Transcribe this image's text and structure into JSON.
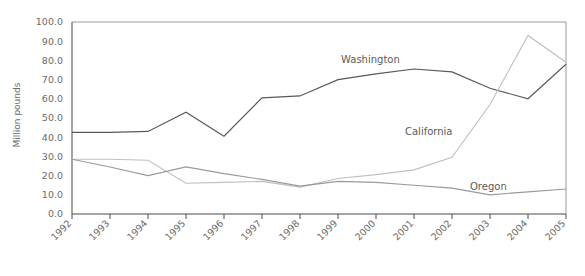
{
  "chart_data": {
    "type": "line",
    "title": "",
    "xlabel": "",
    "ylabel": "Million pounds",
    "grid": false,
    "legend": "inline-labels",
    "ylim": [
      0,
      100
    ],
    "ytick_step": 10,
    "ytick_labels": [
      "0.0",
      "10.0",
      "20.0",
      "30.0",
      "40.0",
      "50.0",
      "60.0",
      "70.0",
      "80.0",
      "90.0",
      "100.0"
    ],
    "categories": [
      "1992",
      "1993",
      "1994",
      "1995",
      "1996",
      "1997",
      "1998",
      "1999",
      "2000",
      "2001",
      "2002",
      "2003",
      "2004",
      "2005"
    ],
    "series": [
      {
        "name": "Washington",
        "color": "#595959",
        "label_x": 341,
        "label_y": 63,
        "values": [
          42.5,
          42.5,
          43.0,
          53.0,
          40.5,
          60.5,
          61.5,
          70.0,
          73.0,
          75.5,
          74.0,
          65.5,
          60.0,
          78.0
        ]
      },
      {
        "name": "California",
        "color": "#c0c0c0",
        "label_x": 405,
        "label_y": 135,
        "values": [
          28.5,
          28.5,
          28.0,
          16.0,
          16.5,
          17.0,
          14.0,
          18.5,
          20.5,
          23.0,
          29.5,
          57.0,
          93.0,
          79.0
        ]
      },
      {
        "name": "Oregon",
        "color": "#9a9a9a",
        "label_x": 470,
        "label_y": 190,
        "values": [
          28.5,
          24.5,
          20.0,
          24.5,
          21.0,
          18.0,
          14.5,
          17.0,
          16.5,
          15.0,
          13.5,
          10.0,
          11.5,
          13.0
        ]
      }
    ]
  }
}
